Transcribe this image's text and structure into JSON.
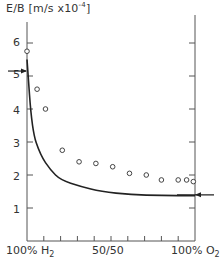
{
  "chart_data": {
    "type": "scatter",
    "title": "",
    "ylabel": "E/B [m/s x10^-4]",
    "ylabel_parts": {
      "main": "E/B [m/s x10",
      "exp": "-4",
      "close": "]"
    },
    "xlabel": "",
    "x_tick_labels": [
      {
        "pos": 0,
        "main": "100% H",
        "sub": "2"
      },
      {
        "pos": 50,
        "main": "50/50",
        "sub": ""
      },
      {
        "pos": 100,
        "main": "100% O",
        "sub": "2"
      }
    ],
    "y_tick_labels": [
      "1",
      "2",
      "3",
      "4",
      "5",
      "6"
    ],
    "xlim": [
      0,
      100
    ],
    "ylim": [
      0,
      6.5
    ],
    "grid": false,
    "series": [
      {
        "name": "measured",
        "style": "open-circle",
        "x": [
          0,
          6,
          11,
          21,
          31,
          41,
          51,
          61,
          71,
          80,
          90,
          95,
          99
        ],
        "y": [
          5.75,
          4.6,
          4.0,
          2.75,
          2.4,
          2.35,
          2.25,
          2.05,
          2.0,
          1.85,
          1.85,
          1.85,
          1.8
        ]
      },
      {
        "name": "calculated",
        "style": "line",
        "x": [
          0,
          3,
          8,
          14,
          20,
          32,
          44,
          62,
          80,
          100
        ],
        "y": [
          5.5,
          3.35,
          2.6,
          2.15,
          1.85,
          1.65,
          1.5,
          1.4,
          1.38,
          1.37
        ]
      }
    ],
    "annotations": [
      {
        "type": "arrow",
        "side": "left",
        "y": 5.15,
        "note": "pure H2 reference value"
      },
      {
        "type": "arrow",
        "side": "right",
        "y": 1.4,
        "note": "pure O2 reference value"
      }
    ]
  }
}
